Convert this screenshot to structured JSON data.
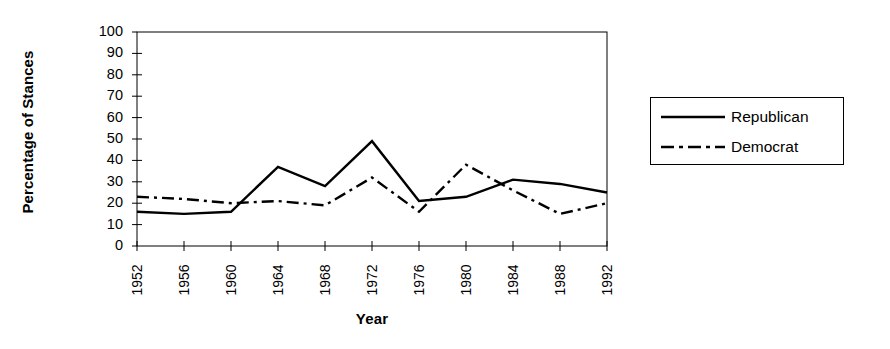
{
  "chart_data": {
    "type": "line",
    "title": "",
    "xlabel": "Year",
    "ylabel": "Percentage of Stances",
    "xlim": [
      1952,
      1992
    ],
    "ylim": [
      0,
      100
    ],
    "ytick_step": 10,
    "grid": false,
    "legend_position": "right",
    "x": [
      1952,
      1956,
      1960,
      1964,
      1968,
      1972,
      1976,
      1980,
      1984,
      1988,
      1992
    ],
    "categories": [
      "1952",
      "1956",
      "1960",
      "1964",
      "1968",
      "1972",
      "1976",
      "1980",
      "1984",
      "1988",
      "1992"
    ],
    "yticks": [
      0,
      10,
      20,
      30,
      40,
      50,
      60,
      70,
      80,
      90,
      100
    ],
    "ytick_labels": [
      "0",
      "10",
      "20",
      "30",
      "40",
      "50",
      "60",
      "70",
      "80",
      "90",
      "100"
    ],
    "series": [
      {
        "name": "Republican",
        "style": "solid",
        "color": "#000000",
        "values": [
          16,
          15,
          16,
          37,
          28,
          49,
          21,
          23,
          31,
          29,
          25
        ]
      },
      {
        "name": "Democrat",
        "style": "dash-dot",
        "color": "#000000",
        "values": [
          23,
          22,
          20,
          21,
          19,
          32,
          16,
          38,
          26,
          15,
          20
        ]
      }
    ]
  },
  "legend": {
    "entries": [
      {
        "label": "Republican",
        "style": "solid"
      },
      {
        "label": "Democrat",
        "style": "dash-dot"
      }
    ]
  }
}
